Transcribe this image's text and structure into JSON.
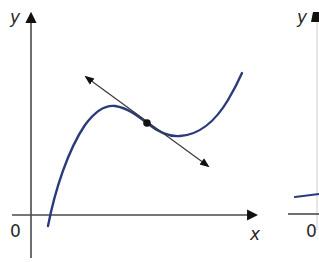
{
  "figure": {
    "colors": {
      "axis": "#4a4a4a",
      "curve": "#2b3a7a",
      "tangent": "#3a3a3a",
      "point": "#111111",
      "background": "#ffffff"
    },
    "left_graph": {
      "y_label": "y",
      "x_label": "x",
      "origin_label": "0",
      "curve_description": "cubic-shaped curve with a local maximum, a local minimum, and a tangent line drawn at a point between them",
      "tangent_point": "marked point on curve with tangent line (arrows both ends)"
    },
    "right_graph": {
      "y_label": "y",
      "origin_label": "0",
      "partial": true
    }
  }
}
